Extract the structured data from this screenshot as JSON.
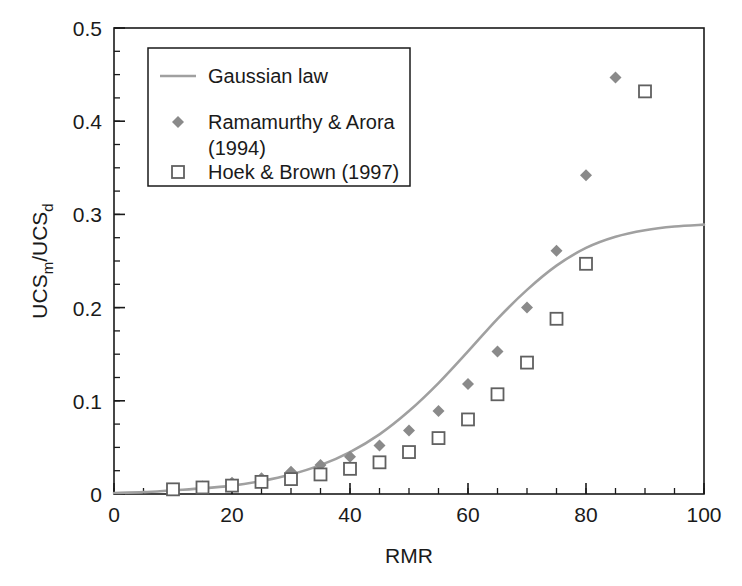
{
  "chart_data": {
    "type": "scatter",
    "title": "",
    "xlabel": "RMR",
    "ylabel_parts": {
      "main1": "UCS",
      "sub1": "m",
      "slash": "/UCS",
      "sub2": "d"
    },
    "ylabel": "UCSm/UCSd",
    "xlim": [
      0,
      100
    ],
    "ylim": [
      0,
      0.5
    ],
    "xticks": [
      0,
      20,
      40,
      60,
      80,
      100
    ],
    "xtick_labels": [
      "0",
      "20",
      "40",
      "60",
      "80",
      "100"
    ],
    "x_minor_step": 5,
    "yticks": [
      0,
      0.1,
      0.2,
      0.3,
      0.4,
      0.5
    ],
    "ytick_labels": [
      "0",
      "0.1",
      "0.2",
      "0.3",
      "0.4",
      "0.5"
    ],
    "y_minor_step": 0.025,
    "grid": false,
    "legend_position": "upper-left-inside",
    "series": [
      {
        "name": "Gaussian law",
        "marker": "line",
        "color": "#a0a0a0",
        "x": [
          0,
          5,
          10,
          15,
          20,
          25,
          30,
          35,
          40,
          45,
          50,
          55,
          60,
          65,
          70,
          75,
          80,
          85,
          90,
          95,
          100
        ],
        "values": [
          0.001,
          0.002,
          0.004,
          0.006,
          0.009,
          0.014,
          0.021,
          0.031,
          0.045,
          0.064,
          0.089,
          0.119,
          0.153,
          0.188,
          0.219,
          0.245,
          0.264,
          0.276,
          0.283,
          0.287,
          0.289
        ]
      },
      {
        "name": "Ramamurthy & Arora (1994)",
        "marker": "diamond",
        "color": "#8a8a8a",
        "x": [
          10,
          15,
          20,
          25,
          30,
          35,
          40,
          45,
          50,
          55,
          60,
          65,
          70,
          75,
          80,
          85
        ],
        "values": [
          0.005,
          0.008,
          0.012,
          0.017,
          0.024,
          0.031,
          0.04,
          0.052,
          0.068,
          0.089,
          0.118,
          0.153,
          0.2,
          0.261,
          0.342,
          0.447
        ]
      },
      {
        "name": "Hoek & Brown (1997)",
        "marker": "square-open",
        "color": "#606060",
        "x": [
          10,
          15,
          20,
          25,
          30,
          35,
          40,
          45,
          50,
          55,
          60,
          65,
          70,
          75,
          80,
          90
        ],
        "values": [
          0.005,
          0.007,
          0.009,
          0.013,
          0.016,
          0.021,
          0.027,
          0.034,
          0.045,
          0.06,
          0.08,
          0.107,
          0.141,
          0.188,
          0.247,
          0.432
        ]
      }
    ],
    "legend_entries": [
      {
        "label": "Gaussian law",
        "marker": "line",
        "color": "#a0a0a0"
      },
      {
        "label": "Ramamurthy & Arora",
        "label2": "(1994)",
        "marker": "diamond",
        "color": "#8a8a8a"
      },
      {
        "label": "Hoek & Brown (1997)",
        "marker": "square-open",
        "color": "#606060"
      }
    ]
  }
}
